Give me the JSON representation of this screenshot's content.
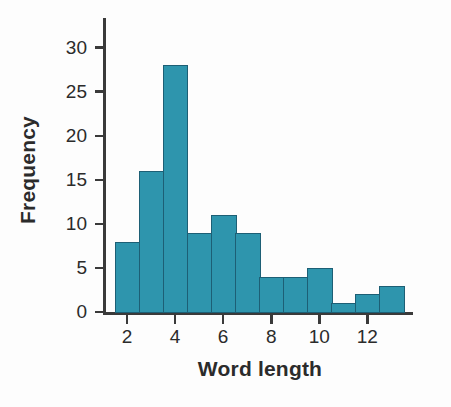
{
  "chart_data": {
    "type": "bar",
    "title": "",
    "subtitle": "",
    "xlabel": "Word length",
    "ylabel": "Frequency",
    "categories": [
      2,
      3,
      4,
      5,
      6,
      7,
      8,
      9,
      10,
      11,
      12,
      13
    ],
    "values": [
      8,
      16,
      28,
      9,
      11,
      9,
      4,
      4,
      5,
      1,
      2,
      3
    ],
    "bin_edges": [
      1.5,
      2.5,
      3.5,
      4.5,
      5.5,
      6.5,
      7.5,
      8.5,
      9.5,
      10.5,
      11.5,
      12.5,
      13.5
    ],
    "xlim": [
      1.0,
      13.9
    ],
    "ylim": [
      0,
      32
    ],
    "xticks": [
      2,
      4,
      6,
      8,
      10,
      12
    ],
    "xtick_labels": [
      "2",
      "4",
      "6",
      "8",
      "10",
      "12"
    ],
    "yticks": [
      0,
      5,
      10,
      15,
      20,
      25,
      30
    ],
    "ytick_labels": [
      "0",
      "5",
      "10",
      "15",
      "20",
      "25",
      "30"
    ],
    "grid": false,
    "legend": "none",
    "bar_color": "#2e95ad",
    "bar_edge_color": "#1d5f75",
    "axis_color": "#3a3a3a",
    "text_color": "#2b2b2b",
    "background": "#fdfdfd"
  }
}
